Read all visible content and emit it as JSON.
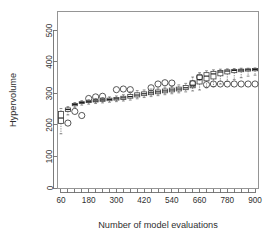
{
  "chart_data": {
    "type": "box",
    "title": "",
    "xlabel": "Number of model evaluations",
    "ylabel": "Hypervolume",
    "xlim": [
      45,
      915
    ],
    "ylim": [
      0,
      560
    ],
    "ytick_values": [
      0,
      100,
      200,
      300,
      400,
      500
    ],
    "ytick_labels": [
      "0",
      "100",
      "200",
      "300",
      "400",
      "500"
    ],
    "xtick_values": [
      60,
      90,
      120,
      150,
      180,
      210,
      240,
      270,
      300,
      330,
      360,
      390,
      420,
      450,
      480,
      510,
      540,
      570,
      600,
      630,
      660,
      690,
      720,
      750,
      780,
      810,
      840,
      870,
      900
    ],
    "xtick_labeled": [
      60,
      180,
      300,
      420,
      540,
      660,
      780,
      900
    ],
    "xtick_labels": [
      "60",
      "180",
      "300",
      "420",
      "540",
      "660",
      "780",
      "900"
    ],
    "grid": false,
    "legend": null,
    "box_width": 22,
    "boxes": [
      {
        "x": 60,
        "whisker_low": 172,
        "q1": 205,
        "median": 222,
        "q3": 243,
        "whisker_high": 252,
        "outliers": []
      },
      {
        "x": 90,
        "whisker_low": 232,
        "q1": 243,
        "median": 249,
        "q3": 254,
        "whisker_high": 258,
        "outliers": [
          206
        ]
      },
      {
        "x": 120,
        "whisker_low": 256,
        "q1": 261,
        "median": 265,
        "q3": 268,
        "whisker_high": 271,
        "outliers": [
          243
        ]
      },
      {
        "x": 150,
        "whisker_low": 263,
        "q1": 268,
        "median": 271,
        "q3": 274,
        "whisker_high": 277,
        "outliers": [
          230
        ]
      },
      {
        "x": 180,
        "whisker_low": 266,
        "q1": 271,
        "median": 274,
        "q3": 277,
        "whisker_high": 280,
        "outliers": [
          284
        ]
      },
      {
        "x": 210,
        "whisker_low": 268,
        "q1": 273,
        "median": 276,
        "q3": 280,
        "whisker_high": 284,
        "outliers": [
          289
        ]
      },
      {
        "x": 240,
        "whisker_low": 270,
        "q1": 275,
        "median": 279,
        "q3": 283,
        "whisker_high": 287,
        "outliers": [
          291
        ]
      },
      {
        "x": 270,
        "whisker_low": 272,
        "q1": 277,
        "median": 281,
        "q3": 285,
        "whisker_high": 289,
        "outliers": []
      },
      {
        "x": 300,
        "whisker_low": 274,
        "q1": 279,
        "median": 283,
        "q3": 287,
        "whisker_high": 292,
        "outliers": [
          312
        ]
      },
      {
        "x": 330,
        "whisker_low": 276,
        "q1": 281,
        "median": 286,
        "q3": 291,
        "whisker_high": 296,
        "outliers": [
          314
        ]
      },
      {
        "x": 360,
        "whisker_low": 279,
        "q1": 285,
        "median": 290,
        "q3": 297,
        "whisker_high": 305,
        "outliers": [
          312
        ]
      },
      {
        "x": 390,
        "whisker_low": 283,
        "q1": 289,
        "median": 295,
        "q3": 302,
        "whisker_high": 309,
        "outliers": []
      },
      {
        "x": 420,
        "whisker_low": 287,
        "q1": 293,
        "median": 299,
        "q3": 305,
        "whisker_high": 311,
        "outliers": []
      },
      {
        "x": 450,
        "whisker_low": 290,
        "q1": 296,
        "median": 302,
        "q3": 308,
        "whisker_high": 314,
        "outliers": [
          318
        ]
      },
      {
        "x": 480,
        "whisker_low": 293,
        "q1": 299,
        "median": 305,
        "q3": 311,
        "whisker_high": 317,
        "outliers": [
          330
        ]
      },
      {
        "x": 510,
        "whisker_low": 296,
        "q1": 302,
        "median": 308,
        "q3": 314,
        "whisker_high": 320,
        "outliers": [
          334
        ]
      },
      {
        "x": 540,
        "whisker_low": 299,
        "q1": 305,
        "median": 311,
        "q3": 317,
        "whisker_high": 323,
        "outliers": [
          333
        ]
      },
      {
        "x": 570,
        "whisker_low": 302,
        "q1": 308,
        "median": 314,
        "q3": 320,
        "whisker_high": 327,
        "outliers": []
      },
      {
        "x": 600,
        "whisker_low": 305,
        "q1": 312,
        "median": 318,
        "q3": 325,
        "whisker_high": 332,
        "outliers": []
      },
      {
        "x": 630,
        "whisker_low": 308,
        "q1": 318,
        "median": 326,
        "q3": 340,
        "whisker_high": 352,
        "outliers": [
          331
        ]
      },
      {
        "x": 660,
        "whisker_low": 311,
        "q1": 330,
        "median": 344,
        "q3": 358,
        "whisker_high": 366,
        "outliers": [
          352
        ]
      },
      {
        "x": 690,
        "whisker_low": 318,
        "q1": 340,
        "median": 355,
        "q3": 366,
        "whisker_high": 372,
        "outliers": [
          328
        ]
      },
      {
        "x": 720,
        "whisker_low": 322,
        "q1": 346,
        "median": 362,
        "q3": 370,
        "whisker_high": 375,
        "outliers": [
          330
        ]
      },
      {
        "x": 750,
        "whisker_low": 330,
        "q1": 356,
        "median": 368,
        "q3": 373,
        "whisker_high": 377,
        "outliers": [
          330
        ]
      },
      {
        "x": 780,
        "whisker_low": 338,
        "q1": 362,
        "median": 371,
        "q3": 375,
        "whisker_high": 378,
        "outliers": [
          330
        ]
      },
      {
        "x": 810,
        "whisker_low": 344,
        "q1": 366,
        "median": 373,
        "q3": 376,
        "whisker_high": 379,
        "outliers": [
          330
        ]
      },
      {
        "x": 840,
        "whisker_low": 350,
        "q1": 369,
        "median": 374,
        "q3": 377,
        "whisker_high": 380,
        "outliers": [
          330
        ]
      },
      {
        "x": 870,
        "whisker_low": 355,
        "q1": 371,
        "median": 375,
        "q3": 378,
        "whisker_high": 380,
        "outliers": [
          330
        ]
      },
      {
        "x": 900,
        "whisker_low": 358,
        "q1": 372,
        "median": 376,
        "q3": 379,
        "whisker_high": 381,
        "outliers": [
          330
        ]
      }
    ]
  }
}
